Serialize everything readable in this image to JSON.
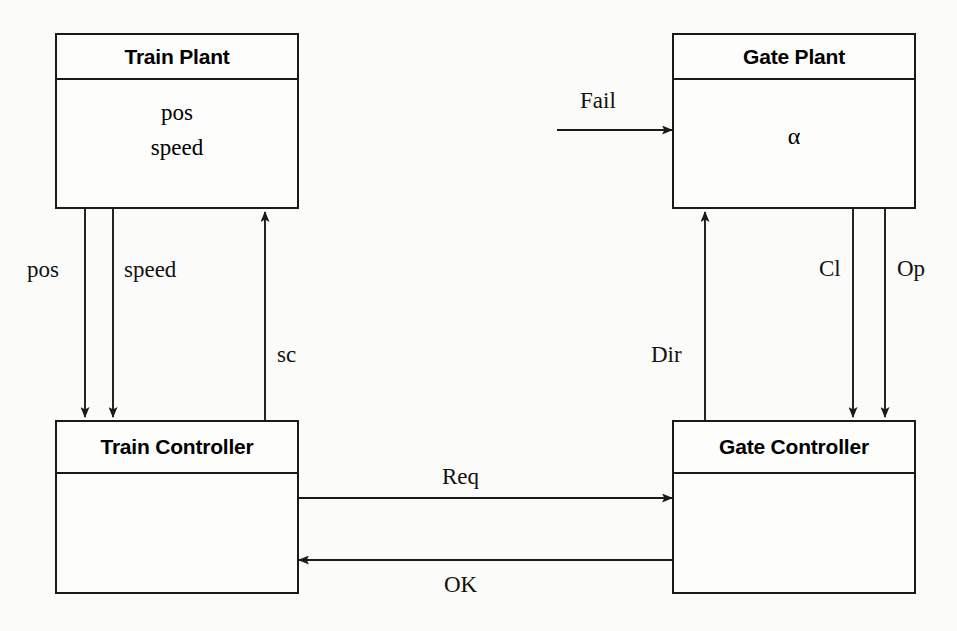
{
  "diagram": {
    "components": [
      {
        "id": "train-plant",
        "name": "Train Plant",
        "attributes": [
          "pos",
          "speed"
        ]
      },
      {
        "id": "gate-plant",
        "name": "Gate Plant",
        "attributes": [
          "α"
        ]
      },
      {
        "id": "train-controller",
        "name": "Train Controller",
        "attributes": []
      },
      {
        "id": "gate-controller",
        "name": "Gate Controller",
        "attributes": []
      }
    ],
    "connections": [
      {
        "id": "pos",
        "label": "pos",
        "from": "train-plant",
        "to": "train-controller",
        "direction": "down"
      },
      {
        "id": "speed",
        "label": "speed",
        "from": "train-plant",
        "to": "train-controller",
        "direction": "down"
      },
      {
        "id": "sc",
        "label": "sc",
        "from": "train-controller",
        "to": "train-plant",
        "direction": "up"
      },
      {
        "id": "fail",
        "label": "Fail",
        "from": "environment",
        "to": "gate-plant",
        "direction": "right"
      },
      {
        "id": "dir",
        "label": "Dir",
        "from": "gate-controller",
        "to": "gate-plant",
        "direction": "up"
      },
      {
        "id": "cl",
        "label": "Cl",
        "from": "gate-plant",
        "to": "gate-controller",
        "direction": "down"
      },
      {
        "id": "op",
        "label": "Op",
        "from": "gate-plant",
        "to": "gate-controller",
        "direction": "down"
      },
      {
        "id": "req",
        "label": "Req",
        "from": "train-controller",
        "to": "gate-controller",
        "direction": "right"
      },
      {
        "id": "ok",
        "label": "OK",
        "from": "gate-controller",
        "to": "train-controller",
        "direction": "left"
      }
    ],
    "colors": {
      "stroke": "#1a1a1a",
      "background": "#fbfbf9",
      "box_fill": "#fdfdfc"
    }
  }
}
